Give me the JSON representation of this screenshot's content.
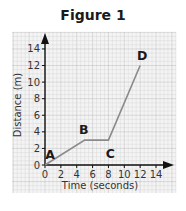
{
  "chart_data": {
    "type": "line",
    "title": "Figure 1",
    "xlabel": "Time (seconds)",
    "ylabel": "Distance (m)",
    "xlim": [
      0,
      14
    ],
    "ylim": [
      0,
      14
    ],
    "xticks": [
      0,
      2,
      4,
      6,
      8,
      10,
      12,
      14
    ],
    "yticks": [
      0,
      2,
      4,
      6,
      8,
      10,
      12,
      14
    ],
    "grid": true,
    "series": [
      {
        "name": "Distance vs Time",
        "points": [
          {
            "label": "A",
            "x": 0,
            "y": 0
          },
          {
            "label": "B",
            "x": 5,
            "y": 3
          },
          {
            "label": "C",
            "x": 8,
            "y": 3
          },
          {
            "label": "D",
            "x": 12,
            "y": 12
          }
        ]
      }
    ]
  },
  "colors": {
    "line": "#8a8a8a",
    "axis": "#111111",
    "grid_minor": "#d9d9d9",
    "grid_major": "#bdbdbd",
    "grid_bg": "#f4f4f4"
  }
}
